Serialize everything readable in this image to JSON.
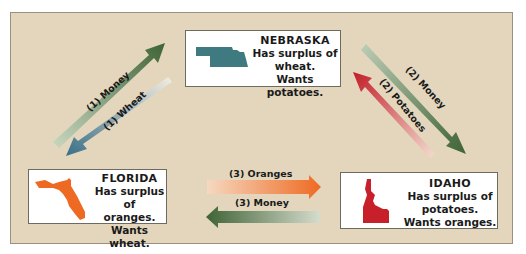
{
  "states": {
    "nebraska": {
      "name": "NEBRASKA",
      "line1": "Has surplus of",
      "line2": "wheat.",
      "line3": "Wants potatoes.",
      "color": "#3f7a80"
    },
    "florida": {
      "name": "FLORIDA",
      "line1": "Has surplus of",
      "line2": "oranges.",
      "line3": "Wants wheat.",
      "color": "#ee6a22"
    },
    "idaho": {
      "name": "IDAHO",
      "line1": "Has surplus of",
      "line2": "potatoes.",
      "line3": "Wants oranges.",
      "color": "#c8202a"
    }
  },
  "flows": [
    {
      "id": "1-money",
      "label": "(1) Money",
      "from": "Florida",
      "to": "Nebraska",
      "color": "#4a6a3e"
    },
    {
      "id": "1-wheat",
      "label": "(1) Wheat",
      "from": "Nebraska",
      "to": "Florida",
      "color": "#3c6e86"
    },
    {
      "id": "2-money",
      "label": "(2) Money",
      "from": "Nebraska",
      "to": "Idaho",
      "color": "#4a6a3e"
    },
    {
      "id": "2-potatoes",
      "label": "(2) Potatoes",
      "from": "Idaho",
      "to": "Nebraska",
      "color": "#c8202a"
    },
    {
      "id": "3-oranges",
      "label": "(3) Oranges",
      "from": "Florida",
      "to": "Idaho",
      "color": "#ee6a22"
    },
    {
      "id": "3-money",
      "label": "(3) Money",
      "from": "Idaho",
      "to": "Florida",
      "color": "#4a6a3e"
    }
  ],
  "colors": {
    "background": "#e3d6bc",
    "money": "#4a6a3e"
  }
}
